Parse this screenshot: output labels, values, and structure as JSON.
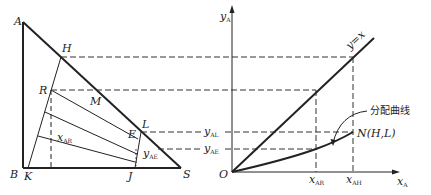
{
  "figure": {
    "left_panel": {
      "type": "triangular phase diagram",
      "vertices": {
        "A": "A",
        "B": "B",
        "S": "S"
      },
      "points": {
        "H": "H",
        "R": "R",
        "M": "M",
        "L": "L",
        "E": "E",
        "K": "K",
        "J": "J"
      },
      "labels": {
        "x_AR_main": "x",
        "x_AR_sub": "AR",
        "y_AE_main": "y",
        "y_AE_sub": "AE"
      }
    },
    "right_panel": {
      "type": "distribution curve plot",
      "y_axis": {
        "main": "y",
        "sub": "A"
      },
      "x_axis": {
        "main": "x",
        "sub": "A"
      },
      "origin": "O",
      "diagonal_label": "y=x",
      "y_ticks": [
        {
          "main": "y",
          "sub": "AL"
        },
        {
          "main": "y",
          "sub": "AE"
        }
      ],
      "x_ticks": [
        {
          "main": "x",
          "sub": "AR"
        },
        {
          "main": "x",
          "sub": "AH"
        }
      ],
      "curve_annotation": "分配曲线",
      "end_point_label": "N(H,L)"
    }
  }
}
